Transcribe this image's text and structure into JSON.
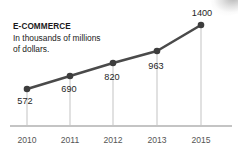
{
  "chart_data": {
    "type": "line",
    "title": "E-COMMERCE",
    "subtitle_line1": "In thousands of millions",
    "subtitle_line2": "of dollars.",
    "xlabel": "",
    "ylabel": "",
    "categories": [
      "2010",
      "2011",
      "2012",
      "2013",
      "2015"
    ],
    "values": [
      572,
      690,
      820,
      963,
      1400
    ],
    "value_labels": [
      "572",
      "690",
      "820",
      "963",
      "1400"
    ],
    "ylim": [
      0,
      1500
    ],
    "grid": false,
    "legend": "none",
    "series": [
      {
        "name": "E-commerce",
        "values": [
          572,
          690,
          820,
          963,
          1400
        ]
      }
    ],
    "colors": {
      "line": "#4a4a4a",
      "marker": "#3d3d3d",
      "stem": "#c9c9c9",
      "axis": "#b0b0b0",
      "title_text": "#1a1a1a",
      "value_text": "#1f1f1f",
      "year_text": "#555555"
    },
    "points": [
      {
        "category": "2010",
        "value": 572,
        "label": "572",
        "cx": 27,
        "cy": 89,
        "label_x": 25,
        "label_y": 104,
        "label_pos": "below"
      },
      {
        "category": "2011",
        "value": 690,
        "label": "690",
        "cx": 70,
        "cy": 76,
        "label_x": 69,
        "label_y": 92,
        "label_pos": "below"
      },
      {
        "category": "2012",
        "value": 820,
        "label": "820",
        "cx": 113,
        "cy": 63,
        "label_x": 112,
        "label_y": 80,
        "label_pos": "below"
      },
      {
        "category": "2013",
        "value": 963,
        "label": "963",
        "cx": 157,
        "cy": 51,
        "label_x": 156,
        "label_y": 69,
        "label_pos": "below"
      },
      {
        "category": "2015",
        "value": 1400,
        "label": "1400",
        "cx": 201,
        "cy": 25,
        "label_x": 202,
        "label_y": 16,
        "label_pos": "above"
      }
    ],
    "axis": {
      "baseline_y": 126,
      "baseline_x1": 10,
      "baseline_x2": 232,
      "tick_label_y": 143
    }
  }
}
